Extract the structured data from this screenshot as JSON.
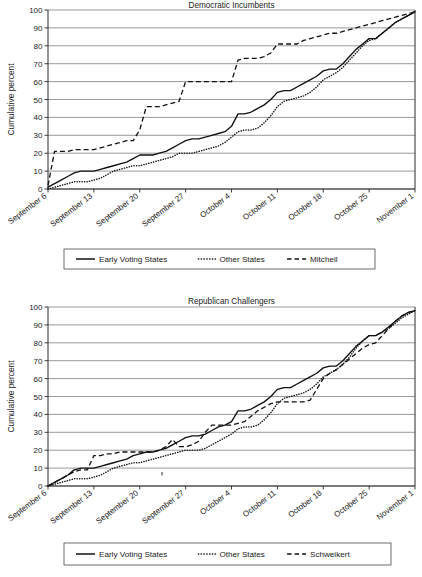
{
  "page": {
    "background": "#ffffff",
    "ink_color": "#111111",
    "gridline_color": "#6f6f6f"
  },
  "chart_data": [
    {
      "id": "democratic-incumbents",
      "type": "line",
      "title": "Democratic Incumbents",
      "xlabel": "",
      "ylabel": "Cumulative percent",
      "ylim": [
        0,
        100
      ],
      "ytick_step": 10,
      "yticks": [
        0,
        10,
        20,
        30,
        40,
        50,
        60,
        70,
        80,
        90,
        100
      ],
      "grid": true,
      "grid_axis": "y",
      "legend_position": "bottom",
      "x_unit": "days since September 6",
      "xlim_days": [
        0,
        56
      ],
      "xticks_days": [
        0,
        7,
        14,
        21,
        28,
        35,
        42,
        49,
        56
      ],
      "xtick_labels": [
        "September 6",
        "September 13",
        "September 20",
        "September 27",
        "October 4",
        "October 11",
        "October 18",
        "October 25",
        "November 1"
      ],
      "series": [
        {
          "name": "Early Voting States",
          "style": "solid",
          "x": [
            0,
            1,
            2,
            3,
            4,
            5,
            6,
            7,
            8,
            9,
            10,
            11,
            12,
            13,
            14,
            15,
            16,
            17,
            18,
            19,
            20,
            21,
            22,
            23,
            24,
            25,
            26,
            27,
            28,
            29,
            30,
            31,
            32,
            33,
            34,
            35,
            36,
            37,
            38,
            39,
            40,
            41,
            42,
            43,
            44,
            45,
            46,
            47,
            48,
            49,
            50,
            51,
            52,
            53,
            54,
            55,
            56
          ],
          "values": [
            1,
            3,
            5,
            7,
            9,
            10,
            10,
            10,
            11,
            12,
            13,
            14,
            15,
            17,
            19,
            19,
            19,
            20,
            21,
            23,
            25,
            27,
            28,
            28,
            29,
            30,
            31,
            32,
            35,
            42,
            42,
            43,
            45,
            47,
            50,
            54,
            55,
            55,
            57,
            59,
            61,
            63,
            66,
            67,
            67,
            70,
            74,
            78,
            81,
            84,
            84,
            87,
            90,
            93,
            95,
            97,
            99
          ]
        },
        {
          "name": "Other States",
          "style": "dotted",
          "x": [
            0,
            1,
            2,
            3,
            4,
            5,
            6,
            7,
            8,
            9,
            10,
            11,
            12,
            13,
            14,
            15,
            16,
            17,
            18,
            19,
            20,
            21,
            22,
            23,
            24,
            25,
            26,
            27,
            28,
            29,
            30,
            31,
            32,
            33,
            34,
            35,
            36,
            37,
            38,
            39,
            40,
            41,
            42,
            43,
            44,
            45,
            46,
            47,
            48,
            49,
            50,
            51,
            52,
            53,
            54,
            55,
            56
          ],
          "values": [
            0,
            1,
            2,
            3,
            4,
            4,
            4,
            5,
            6,
            8,
            10,
            11,
            12,
            13,
            13,
            14,
            15,
            16,
            17,
            18,
            20,
            20,
            20,
            21,
            22,
            23,
            24,
            26,
            29,
            32,
            33,
            33,
            34,
            37,
            41,
            46,
            49,
            50,
            51,
            52,
            54,
            57,
            61,
            63,
            65,
            68,
            72,
            76,
            80,
            83,
            84,
            87,
            90,
            93,
            95,
            97,
            99
          ]
        },
        {
          "name": "Mitchell",
          "style": "dashed",
          "x": [
            0,
            1,
            2,
            3,
            4,
            5,
            6,
            7,
            8,
            9,
            10,
            11,
            12,
            13,
            14,
            15,
            16,
            17,
            18,
            19,
            20,
            21,
            22,
            23,
            24,
            25,
            26,
            27,
            28,
            29,
            30,
            31,
            32,
            33,
            34,
            35,
            36,
            37,
            38,
            39,
            40,
            41,
            42,
            43,
            44,
            45,
            46,
            47,
            48,
            49,
            50,
            51,
            52,
            53,
            54,
            55,
            56
          ],
          "values": [
            2,
            21,
            21,
            21,
            22,
            22,
            22,
            22,
            23,
            24,
            25,
            26,
            27,
            27,
            33,
            46,
            46,
            46,
            47,
            48,
            49,
            60,
            60,
            60,
            60,
            60,
            60,
            60,
            60,
            72,
            73,
            73,
            73,
            74,
            76,
            81,
            81,
            81,
            81,
            83,
            84,
            85,
            86,
            87,
            87,
            88,
            89,
            90,
            91,
            92,
            93,
            94,
            95,
            96,
            97,
            98,
            99
          ]
        }
      ]
    },
    {
      "id": "republican-challengers",
      "type": "line",
      "title": "Republican Challengers",
      "xlabel": "",
      "ylabel": "Cumulative percent",
      "ylim": [
        0,
        100
      ],
      "ytick_step": 10,
      "yticks": [
        0,
        10,
        20,
        30,
        40,
        50,
        60,
        70,
        80,
        90,
        100
      ],
      "grid": true,
      "grid_axis": "y",
      "legend_position": "bottom",
      "x_unit": "days since September 6",
      "xlim_days": [
        0,
        56
      ],
      "xticks_days": [
        0,
        7,
        14,
        21,
        28,
        35,
        42,
        49,
        56
      ],
      "xtick_labels": [
        "September 6",
        "September 13",
        "September 20",
        "September 27",
        "October 4",
        "October 11",
        "October 18",
        "October 25",
        "November 1"
      ],
      "series": [
        {
          "name": "Early Voting States",
          "style": "solid",
          "x": [
            0,
            1,
            2,
            3,
            4,
            5,
            6,
            7,
            8,
            9,
            10,
            11,
            12,
            13,
            14,
            15,
            16,
            17,
            18,
            19,
            20,
            21,
            22,
            23,
            24,
            25,
            26,
            27,
            28,
            29,
            30,
            31,
            32,
            33,
            34,
            35,
            36,
            37,
            38,
            39,
            40,
            41,
            42,
            43,
            44,
            45,
            46,
            47,
            48,
            49,
            50,
            51,
            52,
            53,
            54,
            55,
            56
          ],
          "values": [
            0,
            2,
            4,
            6,
            9,
            10,
            10,
            10,
            11,
            12,
            13,
            14,
            15,
            17,
            18,
            19,
            19,
            20,
            21,
            23,
            25,
            27,
            28,
            28,
            29,
            31,
            33,
            34,
            36,
            42,
            42,
            43,
            45,
            47,
            50,
            54,
            55,
            55,
            57,
            59,
            61,
            63,
            66,
            67,
            67,
            70,
            74,
            78,
            81,
            84,
            84,
            86,
            89,
            92,
            95,
            97,
            98
          ]
        },
        {
          "name": "Other States",
          "style": "dotted",
          "x": [
            0,
            1,
            2,
            3,
            4,
            5,
            6,
            7,
            8,
            9,
            10,
            11,
            12,
            13,
            14,
            15,
            16,
            17,
            18,
            19,
            20,
            21,
            22,
            23,
            24,
            25,
            26,
            27,
            28,
            29,
            30,
            31,
            32,
            33,
            34,
            35,
            36,
            37,
            38,
            39,
            40,
            41,
            42,
            43,
            44,
            45,
            46,
            47,
            48,
            49,
            50,
            51,
            52,
            53,
            54,
            55,
            56
          ],
          "values": [
            0,
            1,
            2,
            3,
            4,
            4,
            4,
            5,
            6,
            8,
            10,
            11,
            12,
            13,
            13,
            14,
            15,
            16,
            17,
            18,
            19,
            20,
            20,
            20,
            21,
            23,
            25,
            27,
            29,
            32,
            33,
            33,
            34,
            37,
            41,
            46,
            49,
            50,
            51,
            52,
            54,
            57,
            61,
            63,
            65,
            68,
            72,
            77,
            81,
            84,
            84,
            86,
            88,
            91,
            94,
            96,
            98
          ]
        },
        {
          "name": "Schweikert",
          "style": "dashed",
          "x": [
            0,
            1,
            2,
            3,
            4,
            5,
            6,
            7,
            8,
            9,
            10,
            11,
            12,
            13,
            14,
            15,
            16,
            17,
            18,
            19,
            20,
            21,
            22,
            23,
            24,
            25,
            26,
            27,
            28,
            29,
            30,
            31,
            32,
            33,
            34,
            35,
            36,
            37,
            38,
            39,
            40,
            41,
            42,
            43,
            44,
            45,
            46,
            47,
            48,
            49,
            50,
            51,
            52,
            53,
            54,
            55,
            56
          ],
          "values": [
            0,
            2,
            4,
            6,
            8,
            9,
            9,
            17,
            17,
            18,
            18,
            19,
            19,
            19,
            19,
            19,
            19,
            20,
            22,
            26,
            22,
            22,
            23,
            25,
            30,
            34,
            34,
            34,
            34,
            35,
            36,
            39,
            42,
            44,
            46,
            47,
            47,
            47,
            47,
            47,
            48,
            54,
            60,
            63,
            65,
            68,
            71,
            74,
            77,
            79,
            80,
            84,
            88,
            92,
            95,
            97,
            98
          ]
        }
      ]
    }
  ],
  "charts_meta": [
    {
      "legend_items": [
        {
          "label": "Early Voting States",
          "style": "solid"
        },
        {
          "label": "Other States",
          "style": "dotted"
        },
        {
          "label": "Mitchell",
          "style": "dashed"
        }
      ]
    },
    {
      "legend_items": [
        {
          "label": "Early Voting States",
          "style": "solid"
        },
        {
          "label": "Other States",
          "style": "dotted"
        },
        {
          "label": "Schweikert",
          "style": "dashed"
        }
      ]
    }
  ]
}
